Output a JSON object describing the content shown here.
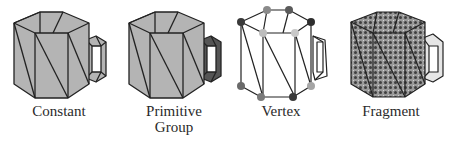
{
  "figure": {
    "panels": [
      {
        "id": "constant",
        "label": "Constant",
        "label_lines": [
          "Constant"
        ],
        "shading": "flat uniform gray per object",
        "fill": "#b4b4b4",
        "handle_fill": "#b4b4b4"
      },
      {
        "id": "primitive-group",
        "label": "Primitive Group",
        "label_lines": [
          "Primitive",
          "Group"
        ],
        "shading": "one color per primitive group (body vs handle)",
        "fill": "#b4b4b4",
        "handle_fill": "#555555"
      },
      {
        "id": "vertex",
        "label": "Vertex",
        "label_lines": [
          "Vertex"
        ],
        "shading": "color per vertex (dots at vertices)",
        "fill": "#ffffff",
        "vertex_colors": [
          "#3a3a3a",
          "#8a8a8a",
          "#bdbdbd",
          "#5a5a5a"
        ]
      },
      {
        "id": "fragment",
        "label": "Fragment",
        "label_lines": [
          "Fragment"
        ],
        "shading": "color per fragment (dotted pattern)",
        "fill": "#9a9a9a",
        "dot_colors": [
          "#3a3a3a",
          "#cfcfcf"
        ]
      }
    ]
  }
}
